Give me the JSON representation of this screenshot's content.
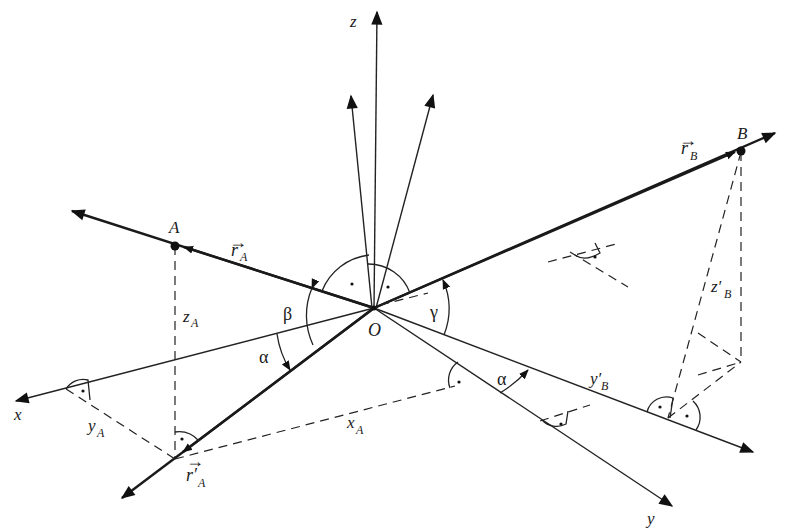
{
  "diagram": {
    "type": "3D coordinate system with position vectors and projections",
    "origin": {
      "label": "O"
    },
    "axes": [
      {
        "id": "x",
        "label": "x"
      },
      {
        "id": "y",
        "label": "y"
      },
      {
        "id": "z",
        "label": "z"
      }
    ],
    "points": [
      {
        "id": "A",
        "label": "A"
      },
      {
        "id": "B",
        "label": "B"
      }
    ],
    "vectors": [
      {
        "id": "r_A",
        "label": "r",
        "subscript": "A",
        "arrow": "→"
      },
      {
        "id": "r_B",
        "label": "r",
        "subscript": "B",
        "arrow": "→"
      },
      {
        "id": "r_prime_A",
        "label": "r′",
        "subscript": "A",
        "arrow": "→"
      }
    ],
    "components": [
      {
        "id": "z_A",
        "label": "z",
        "subscript": "A"
      },
      {
        "id": "y_A",
        "label": "y",
        "subscript": "A"
      },
      {
        "id": "x_A",
        "label": "x",
        "subscript": "A"
      },
      {
        "id": "y_prime_B",
        "label": "y′",
        "subscript": "B"
      },
      {
        "id": "z_prime_B",
        "label": "z′",
        "subscript": "B"
      }
    ],
    "angles": [
      {
        "id": "alpha_left",
        "label": "α"
      },
      {
        "id": "beta",
        "label": "β"
      },
      {
        "id": "gamma",
        "label": "γ"
      },
      {
        "id": "alpha_right",
        "label": "α"
      }
    ],
    "right_angle_marks": 9
  }
}
